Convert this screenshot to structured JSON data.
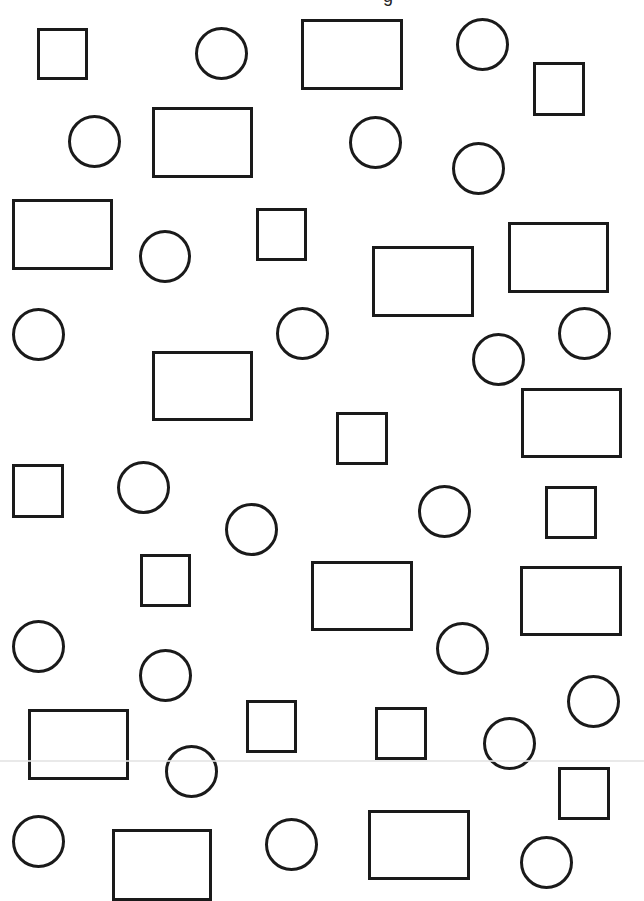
{
  "worksheet": {
    "title_fragment": "g",
    "stroke_color": "#1a1a1a",
    "background_color": "#ffffff",
    "scan_line": {
      "y": 760,
      "color": "#e4e4e4"
    },
    "counts": {
      "squares": 13,
      "circles": 24,
      "rectangles": 14
    },
    "shapes": [
      {
        "type": "square",
        "x": 37,
        "y": 28,
        "w": 51,
        "h": 52
      },
      {
        "type": "circle",
        "x": 195,
        "y": 27,
        "w": 53,
        "h": 53
      },
      {
        "type": "rectangle",
        "x": 301,
        "y": 19,
        "w": 102,
        "h": 71
      },
      {
        "type": "circle",
        "x": 456,
        "y": 18,
        "w": 53,
        "h": 53
      },
      {
        "type": "square",
        "x": 533,
        "y": 62,
        "w": 52,
        "h": 54
      },
      {
        "type": "circle",
        "x": 68,
        "y": 115,
        "w": 53,
        "h": 53
      },
      {
        "type": "rectangle",
        "x": 152,
        "y": 107,
        "w": 101,
        "h": 71
      },
      {
        "type": "circle",
        "x": 349,
        "y": 116,
        "w": 53,
        "h": 53
      },
      {
        "type": "circle",
        "x": 452,
        "y": 142,
        "w": 53,
        "h": 53
      },
      {
        "type": "rectangle",
        "x": 12,
        "y": 199,
        "w": 101,
        "h": 71
      },
      {
        "type": "square",
        "x": 256,
        "y": 208,
        "w": 51,
        "h": 53
      },
      {
        "type": "circle",
        "x": 139,
        "y": 230,
        "w": 52,
        "h": 53
      },
      {
        "type": "rectangle",
        "x": 508,
        "y": 222,
        "w": 101,
        "h": 71
      },
      {
        "type": "rectangle",
        "x": 372,
        "y": 246,
        "w": 102,
        "h": 71
      },
      {
        "type": "circle",
        "x": 12,
        "y": 308,
        "w": 53,
        "h": 53
      },
      {
        "type": "circle",
        "x": 276,
        "y": 307,
        "w": 53,
        "h": 53
      },
      {
        "type": "circle",
        "x": 558,
        "y": 307,
        "w": 53,
        "h": 53
      },
      {
        "type": "circle",
        "x": 472,
        "y": 333,
        "w": 53,
        "h": 53
      },
      {
        "type": "rectangle",
        "x": 152,
        "y": 351,
        "w": 101,
        "h": 70
      },
      {
        "type": "rectangle",
        "x": 521,
        "y": 388,
        "w": 101,
        "h": 70
      },
      {
        "type": "square",
        "x": 336,
        "y": 412,
        "w": 52,
        "h": 53
      },
      {
        "type": "square",
        "x": 12,
        "y": 464,
        "w": 52,
        "h": 54
      },
      {
        "type": "circle",
        "x": 117,
        "y": 461,
        "w": 53,
        "h": 53
      },
      {
        "type": "circle",
        "x": 418,
        "y": 485,
        "w": 53,
        "h": 53
      },
      {
        "type": "square",
        "x": 545,
        "y": 486,
        "w": 52,
        "h": 53
      },
      {
        "type": "circle",
        "x": 225,
        "y": 503,
        "w": 53,
        "h": 53
      },
      {
        "type": "square",
        "x": 140,
        "y": 554,
        "w": 51,
        "h": 53
      },
      {
        "type": "rectangle",
        "x": 311,
        "y": 561,
        "w": 102,
        "h": 70
      },
      {
        "type": "rectangle",
        "x": 520,
        "y": 566,
        "w": 102,
        "h": 70
      },
      {
        "type": "circle",
        "x": 12,
        "y": 620,
        "w": 53,
        "h": 53
      },
      {
        "type": "circle",
        "x": 436,
        "y": 622,
        "w": 53,
        "h": 53
      },
      {
        "type": "circle",
        "x": 139,
        "y": 649,
        "w": 53,
        "h": 53
      },
      {
        "type": "circle",
        "x": 567,
        "y": 675,
        "w": 53,
        "h": 53
      },
      {
        "type": "square",
        "x": 246,
        "y": 700,
        "w": 51,
        "h": 53
      },
      {
        "type": "square",
        "x": 375,
        "y": 707,
        "w": 52,
        "h": 53
      },
      {
        "type": "rectangle",
        "x": 28,
        "y": 709,
        "w": 101,
        "h": 71
      },
      {
        "type": "circle",
        "x": 483,
        "y": 717,
        "w": 53,
        "h": 53
      },
      {
        "type": "circle",
        "x": 165,
        "y": 745,
        "w": 53,
        "h": 53
      },
      {
        "type": "square",
        "x": 558,
        "y": 767,
        "w": 52,
        "h": 53
      },
      {
        "type": "rectangle",
        "x": 368,
        "y": 810,
        "w": 102,
        "h": 70
      },
      {
        "type": "circle",
        "x": 12,
        "y": 815,
        "w": 53,
        "h": 53
      },
      {
        "type": "circle",
        "x": 265,
        "y": 818,
        "w": 53,
        "h": 53
      },
      {
        "type": "rectangle",
        "x": 112,
        "y": 829,
        "w": 100,
        "h": 72
      },
      {
        "type": "circle",
        "x": 520,
        "y": 836,
        "w": 53,
        "h": 53
      }
    ]
  }
}
